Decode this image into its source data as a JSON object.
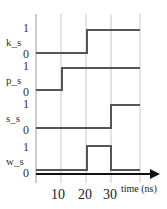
{
  "diagram": {
    "type": "timing-diagram",
    "x_axis": {
      "label": "time (ns)",
      "ticks": [
        {
          "label": "10",
          "x": 61
        },
        {
          "label": "20",
          "x": 86
        },
        {
          "label": "30",
          "x": 111
        }
      ]
    },
    "signals": [
      {
        "name": "k_s",
        "high_label": "1",
        "low_label": "0",
        "y_high": 30,
        "y_low": 53,
        "transitions": [
          {
            "x": 36,
            "level": 0
          },
          {
            "x": 87,
            "level": 1
          }
        ]
      },
      {
        "name": "p_s",
        "high_label": "1",
        "low_label": "0",
        "y_high": 68,
        "y_low": 90,
        "transitions": [
          {
            "x": 36,
            "level": 0
          },
          {
            "x": 62,
            "level": 1
          }
        ]
      },
      {
        "name": "s_s",
        "high_label": "1",
        "low_label": "0",
        "y_high": 105,
        "y_low": 128,
        "transitions": [
          {
            "x": 36,
            "level": 0
          },
          {
            "x": 111,
            "level": 1
          }
        ]
      },
      {
        "name": "w_s",
        "high_label": "1",
        "low_label": "0",
        "y_high": 146,
        "y_low": 170,
        "transitions": [
          {
            "x": 36,
            "level": 0
          },
          {
            "x": 87,
            "level": 1
          },
          {
            "x": 111,
            "level": 0
          }
        ]
      }
    ],
    "gridlines_x": [
      36,
      61,
      86,
      111,
      140
    ],
    "colors": {
      "signal": "#555555",
      "grid": "#c8c8c8",
      "axis": "#111111"
    }
  }
}
